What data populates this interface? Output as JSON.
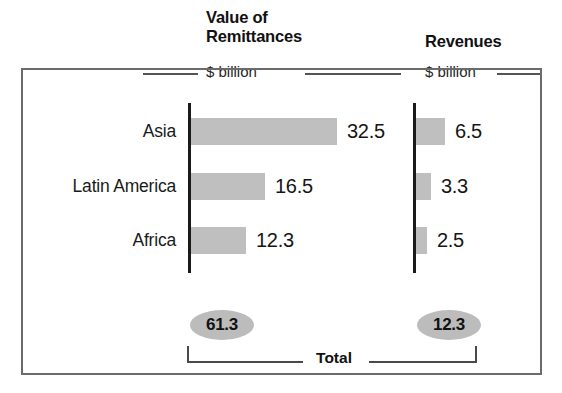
{
  "chart_data": {
    "type": "bar",
    "title": "",
    "orientation": "horizontal",
    "grid": false,
    "legend": false,
    "panels": [
      {
        "title": "Value of\nRemittances",
        "subtitle": "$ billion",
        "categories": [
          "Asia",
          "Latin America",
          "Africa"
        ],
        "values": [
          32.5,
          16.5,
          12.3
        ],
        "value_labels": [
          "32.5",
          "16.5",
          "12.3"
        ],
        "total": 61.3,
        "total_label": "61.3",
        "axis_max": 32.5,
        "unit": "$ billion"
      },
      {
        "title": "Revenues",
        "subtitle": "$ billion",
        "categories": [
          "Asia",
          "Latin America",
          "Africa"
        ],
        "values": [
          6.5,
          3.3,
          2.5
        ],
        "value_labels": [
          "6.5",
          "3.3",
          "2.5"
        ],
        "total": 12.3,
        "total_label": "12.3",
        "axis_max": 32.5,
        "unit": "$ billion"
      }
    ],
    "total_bracket_label": "Total",
    "colors": {
      "bar_fill": "#bfbfbf",
      "axis": "#1a1a1a",
      "frame": "#6b6b6b",
      "total_oval": "#bcbcbc",
      "text": "#1a1a1a"
    }
  },
  "headers": {
    "left_title_line1": "Value of",
    "left_title_line2": "Remittances",
    "left_subtitle": "$ billion",
    "right_title": "Revenues",
    "right_subtitle": "$ billion"
  },
  "rows": [
    {
      "label": "Asia",
      "left_value": "32.5",
      "right_value": "6.5"
    },
    {
      "label": "Latin America",
      "left_value": "16.5",
      "right_value": "3.3"
    },
    {
      "label": "Africa",
      "left_value": "12.3",
      "right_value": "2.5"
    }
  ],
  "totals": {
    "left": "61.3",
    "right": "12.3",
    "bracket_label": "Total"
  }
}
